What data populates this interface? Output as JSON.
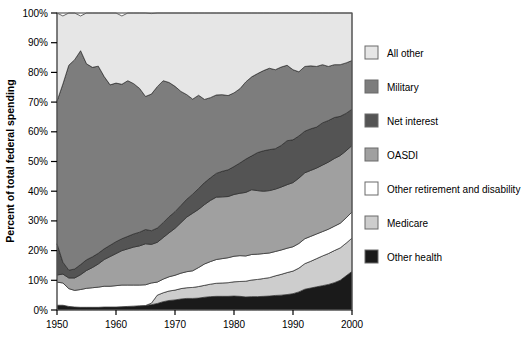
{
  "chart_data": {
    "type": "area",
    "stacked": true,
    "title": "",
    "subtitle": "",
    "xlabel": "",
    "ylabel": "Percent of total federal spending",
    "xlim": [
      1950,
      2000
    ],
    "ylim": [
      0,
      100
    ],
    "grid": false,
    "legend_position": "right",
    "y_tick_labels": [
      "0%",
      "10%",
      "20%",
      "30%",
      "40%",
      "50%",
      "60%",
      "70%",
      "80%",
      "90%",
      "100%"
    ],
    "y_ticks": [
      0,
      10,
      20,
      30,
      40,
      50,
      60,
      70,
      80,
      90,
      100
    ],
    "x_tick_labels": [
      "1950",
      "1960",
      "1970",
      "1980",
      "1990",
      "2000"
    ],
    "x_ticks": [
      1950,
      1960,
      1970,
      1980,
      1990,
      2000
    ],
    "colors": {
      "all_other": "#e6e6e6",
      "military": "#7d7d7d",
      "net_interest": "#545454",
      "oasdi": "#a0a0a0",
      "other_retirement_and_disability": "#ffffff",
      "medicare": "#cdcdcd",
      "other_health": "#1a1a1a",
      "outline": "#2b2b2b",
      "frame": "#5a5a5a",
      "text": "#000000"
    },
    "x": [
      1950,
      1951,
      1952,
      1953,
      1954,
      1955,
      1956,
      1957,
      1958,
      1959,
      1960,
      1961,
      1962,
      1963,
      1964,
      1965,
      1966,
      1967,
      1968,
      1969,
      1970,
      1971,
      1972,
      1973,
      1974,
      1975,
      1976,
      1977,
      1978,
      1979,
      1980,
      1981,
      1982,
      1983,
      1984,
      1985,
      1986,
      1987,
      1988,
      1989,
      1990,
      1991,
      1992,
      1993,
      1994,
      1995,
      1996,
      1997,
      1998,
      1999,
      2000
    ],
    "series": [
      {
        "name": "Other health",
        "color": "#1a1a1a",
        "values": [
          1.6,
          1.6,
          1.2,
          1.0,
          0.9,
          0.9,
          0.9,
          0.9,
          1.0,
          1.0,
          1.0,
          1.1,
          1.2,
          1.3,
          1.4,
          1.5,
          1.8,
          2.2,
          2.8,
          3.2,
          3.4,
          3.7,
          3.9,
          3.9,
          4.0,
          4.3,
          4.5,
          4.6,
          4.6,
          4.6,
          4.7,
          4.6,
          4.4,
          4.5,
          4.5,
          4.6,
          4.7,
          4.9,
          5.0,
          5.2,
          5.5,
          6.1,
          7.0,
          7.4,
          7.8,
          8.2,
          8.6,
          9.2,
          10.0,
          11.5,
          13.0
        ]
      },
      {
        "name": "Medicare",
        "color": "#cdcdcd",
        "values": [
          0.0,
          0.0,
          0.0,
          0.0,
          0.0,
          0.0,
          0.0,
          0.0,
          0.0,
          0.0,
          0.0,
          0.0,
          0.0,
          0.0,
          0.0,
          0.0,
          0.5,
          2.8,
          3.0,
          3.2,
          3.3,
          3.5,
          3.6,
          3.7,
          3.9,
          4.0,
          4.2,
          4.4,
          4.5,
          4.6,
          4.8,
          5.0,
          5.3,
          5.6,
          5.8,
          6.0,
          6.2,
          6.6,
          7.0,
          7.4,
          7.6,
          8.0,
          8.6,
          9.0,
          9.5,
          10.0,
          10.4,
          10.8,
          10.9,
          11.0,
          11.2
        ]
      },
      {
        "name": "Other retirement and disability",
        "color": "#ffffff",
        "values": [
          7.8,
          7.5,
          6.0,
          5.6,
          6.0,
          6.4,
          6.6,
          6.8,
          7.0,
          7.0,
          7.2,
          7.3,
          7.2,
          7.1,
          7.0,
          7.0,
          6.8,
          4.4,
          4.6,
          4.8,
          5.0,
          5.2,
          5.4,
          5.6,
          6.4,
          7.2,
          7.6,
          8.0,
          8.2,
          8.4,
          8.6,
          8.7,
          8.5,
          8.6,
          8.5,
          8.4,
          8.3,
          8.2,
          8.2,
          8.2,
          8.2,
          8.3,
          8.4,
          8.4,
          8.3,
          8.2,
          8.2,
          8.2,
          8.3,
          8.5,
          8.8
        ]
      },
      {
        "name": "OASDI",
        "color": "#a0a0a0",
        "values": [
          2.4,
          3.0,
          3.6,
          4.2,
          5.0,
          6.0,
          6.8,
          7.8,
          9.0,
          10.0,
          10.8,
          11.6,
          12.2,
          12.8,
          13.2,
          13.8,
          13.0,
          13.4,
          14.0,
          14.8,
          15.8,
          17.0,
          18.4,
          19.4,
          19.6,
          20.0,
          20.6,
          21.0,
          20.8,
          20.6,
          20.8,
          21.0,
          21.4,
          21.8,
          21.4,
          21.0,
          21.0,
          21.0,
          21.2,
          21.4,
          21.6,
          22.0,
          22.2,
          22.2,
          22.2,
          22.4,
          22.6,
          22.8,
          22.8,
          22.6,
          22.4
        ]
      },
      {
        "name": "Net interest",
        "color": "#545454",
        "values": [
          10.5,
          4.0,
          2.6,
          3.0,
          3.4,
          3.6,
          3.6,
          3.6,
          3.6,
          3.8,
          4.0,
          4.0,
          4.2,
          4.4,
          4.6,
          4.8,
          4.6,
          4.8,
          5.0,
          5.4,
          5.6,
          5.8,
          6.0,
          6.4,
          7.0,
          7.4,
          7.6,
          8.0,
          8.6,
          9.0,
          9.4,
          10.2,
          11.2,
          11.4,
          12.8,
          13.6,
          13.8,
          13.6,
          14.0,
          14.8,
          14.4,
          14.2,
          14.0,
          14.0,
          13.8,
          14.2,
          14.0,
          13.8,
          13.2,
          12.6,
          12.2
        ]
      },
      {
        "name": "Military",
        "color": "#7d7d7d",
        "values": [
          48.0,
          60.0,
          69.0,
          70.5,
          72.0,
          66.0,
          63.8,
          63.0,
          58.0,
          54.0,
          53.4,
          52.0,
          52.4,
          50.6,
          48.4,
          44.8,
          46.0,
          47.6,
          47.8,
          45.2,
          42.2,
          38.4,
          35.2,
          32.0,
          31.4,
          28.0,
          27.0,
          26.4,
          25.8,
          25.0,
          24.8,
          25.0,
          26.0,
          26.6,
          26.6,
          27.0,
          27.4,
          26.6,
          26.4,
          25.4,
          23.6,
          21.6,
          21.8,
          21.2,
          20.4,
          19.6,
          18.2,
          17.8,
          17.4,
          17.0,
          16.4
        ]
      },
      {
        "name": "All other",
        "color": "#e6e6e6",
        "values": [
          29.7,
          22.9,
          17.6,
          15.7,
          11.7,
          17.1,
          18.3,
          17.9,
          21.4,
          24.2,
          23.6,
          23.0,
          22.8,
          23.8,
          25.4,
          28.1,
          27.1,
          24.8,
          22.8,
          23.4,
          24.7,
          26.4,
          27.5,
          29.0,
          27.7,
          29.1,
          28.5,
          27.6,
          27.5,
          27.8,
          26.9,
          25.5,
          23.2,
          21.5,
          20.4,
          19.4,
          18.6,
          19.1,
          18.2,
          17.6,
          19.1,
          19.8,
          18.0,
          17.8,
          18.0,
          17.4,
          18.0,
          17.4,
          17.4,
          16.8,
          16.0
        ]
      }
    ]
  },
  "legend": {
    "items": [
      {
        "label": "All other",
        "color": "#e6e6e6"
      },
      {
        "label": "Military",
        "color": "#7d7d7d"
      },
      {
        "label": "Net interest",
        "color": "#545454"
      },
      {
        "label": "OASDI",
        "color": "#a0a0a0"
      },
      {
        "label": "Other retirement and disability",
        "color": "#ffffff"
      },
      {
        "label": "Medicare",
        "color": "#cdcdcd"
      },
      {
        "label": "Other health",
        "color": "#1a1a1a"
      }
    ]
  }
}
